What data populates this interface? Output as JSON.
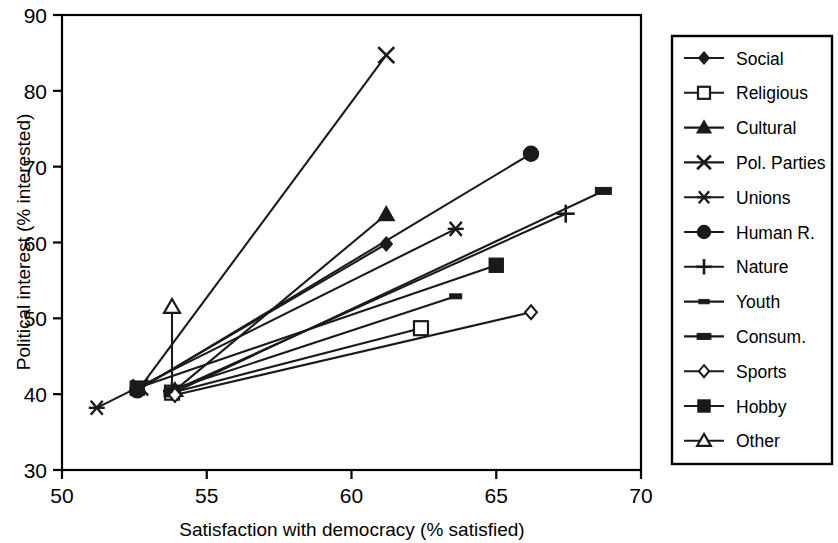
{
  "chart_data": {
    "type": "line",
    "title": "",
    "xlabel": "Satisfaction with democracy (% satisfied)",
    "ylabel": "Political interest (% interested)",
    "xlim": [
      50,
      70
    ],
    "ylim": [
      30,
      90
    ],
    "xticks": [
      50,
      55,
      60,
      65,
      70
    ],
    "yticks": [
      30,
      40,
      50,
      60,
      70,
      80,
      90
    ],
    "grid": false,
    "legend_position": "right-outside",
    "note": "Each series is a two-point segment connecting a low-satisfaction endpoint to a high-satisfaction endpoint.",
    "series": [
      {
        "name": "Social",
        "marker": "filled-diamond",
        "x": [
          52.6,
          61.2
        ],
        "y": [
          40.6,
          59.8
        ]
      },
      {
        "name": "Religious",
        "marker": "open-square",
        "x": [
          53.8,
          62.4
        ],
        "y": [
          40.2,
          48.7
        ]
      },
      {
        "name": "Cultural",
        "marker": "filled-triangle",
        "x": [
          53.9,
          61.2
        ],
        "y": [
          40.5,
          63.7
        ]
      },
      {
        "name": "Pol. Parties",
        "marker": "cross-x",
        "x": [
          52.7,
          61.2
        ],
        "y": [
          40.9,
          84.7
        ]
      },
      {
        "name": "Unions",
        "marker": "asterisk",
        "x": [
          51.2,
          63.6
        ],
        "y": [
          38.2,
          61.8
        ]
      },
      {
        "name": "Human R.",
        "marker": "filled-circle",
        "x": [
          52.6,
          66.2
        ],
        "y": [
          40.5,
          71.7
        ]
      },
      {
        "name": "Nature",
        "marker": "plus",
        "x": [
          53.8,
          67.4
        ],
        "y": [
          40.4,
          63.8
        ]
      },
      {
        "name": "Youth",
        "marker": "dash",
        "x": [
          53.8,
          63.6
        ],
        "y": [
          40.6,
          52.9
        ]
      },
      {
        "name": "Consum.",
        "marker": "thick-dash",
        "x": [
          53.8,
          68.7
        ],
        "y": [
          40.1,
          66.8
        ]
      },
      {
        "name": "Sports",
        "marker": "open-diamond",
        "x": [
          53.9,
          66.2
        ],
        "y": [
          39.9,
          50.8
        ]
      },
      {
        "name": "Hobby",
        "marker": "filled-square",
        "x": [
          52.6,
          65.0
        ],
        "y": [
          40.8,
          57.0
        ]
      },
      {
        "name": "Other",
        "marker": "open-triangle",
        "x": [
          53.8,
          53.8
        ],
        "y": [
          40.2,
          51.5
        ]
      }
    ]
  },
  "legend": {
    "items": [
      {
        "label": "Social"
      },
      {
        "label": "Religious"
      },
      {
        "label": "Cultural"
      },
      {
        "label": "Pol. Parties"
      },
      {
        "label": "Unions"
      },
      {
        "label": "Human R."
      },
      {
        "label": "Nature"
      },
      {
        "label": "Youth"
      },
      {
        "label": "Consum."
      },
      {
        "label": "Sports"
      },
      {
        "label": "Hobby"
      },
      {
        "label": "Other"
      }
    ]
  },
  "colors": {
    "line": "#1a1a1a",
    "axis": "#000000",
    "background": "#ffffff"
  }
}
